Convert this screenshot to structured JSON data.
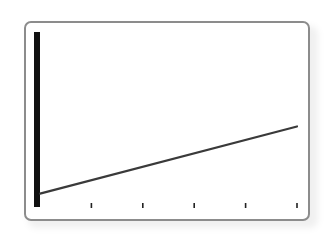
{
  "chart_data": {
    "type": "line",
    "title": "",
    "xlabel": "",
    "ylabel": "",
    "x": [
      0,
      5
    ],
    "series": [
      {
        "name": "line",
        "values": [
          0.5,
          3.2
        ],
        "color": "#3a3a3a"
      }
    ],
    "xlim": [
      0,
      5
    ],
    "ylim": [
      0,
      7
    ],
    "x_ticks": [
      1,
      2,
      3,
      4,
      5
    ],
    "x_tick_labels": [
      "",
      "",
      "",
      "",
      ""
    ],
    "grid": false,
    "legend": null
  },
  "style": {
    "frame_border_color": "#8c8c8c",
    "axis_color": "#111111",
    "line_color": "#3a3a3a",
    "tick_color": "#222222"
  }
}
